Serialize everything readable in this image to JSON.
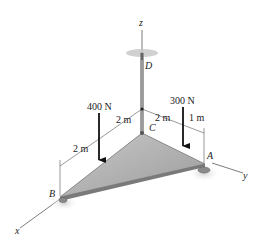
{
  "diagram": {
    "axes": {
      "x": "x",
      "y": "y",
      "z": "z"
    },
    "points": {
      "A": "A",
      "B": "B",
      "C": "C",
      "D": "D"
    },
    "forces": [
      {
        "label": "400 N",
        "direction": "down"
      },
      {
        "label": "300 N",
        "direction": "down"
      }
    ],
    "dimensions": [
      {
        "label": "2 m",
        "location": "C to 400 N along x"
      },
      {
        "label": "2 m",
        "location": "400 N to B along x"
      },
      {
        "label": "2 m",
        "location": "C to 300 N along y"
      },
      {
        "label": "1 m",
        "location": "300 N to A along y"
      }
    ],
    "colors": {
      "plate": "#a9a9a9",
      "plate_edge": "#6e6e6e",
      "line": "#333333",
      "arrow": "#111111"
    }
  }
}
